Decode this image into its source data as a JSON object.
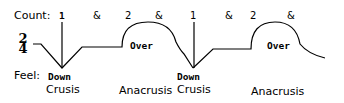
{
  "count": {
    "label": "Count:",
    "beats": [
      "1",
      "&",
      "2",
      "&",
      "1",
      "&",
      "2",
      "&"
    ]
  },
  "time_signature": {
    "top": "2",
    "bottom": "4"
  },
  "feel": {
    "label": "Feel:",
    "down_labels": [
      "Down",
      "Down"
    ],
    "over_labels": [
      "Over",
      "Over"
    ]
  },
  "phases": {
    "crusis": [
      "Crusis",
      "Crusis"
    ],
    "anacrusis": [
      "Anacrusis",
      "Anacrusis"
    ]
  },
  "colors": {
    "stroke": "#000000",
    "background": "#ffffff"
  }
}
